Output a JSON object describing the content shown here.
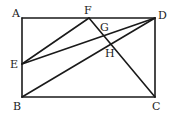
{
  "diagram": {
    "type": "geometry",
    "shape": "rectangle ABCD with segments",
    "points": {
      "A": {
        "label": "A",
        "x": 22,
        "y": 18,
        "lx": 12,
        "ly": 17
      },
      "B": {
        "label": "B",
        "x": 22,
        "y": 97,
        "lx": 13,
        "ly": 110
      },
      "C": {
        "label": "C",
        "x": 155,
        "y": 97,
        "lx": 153,
        "ly": 110
      },
      "D": {
        "label": "D",
        "x": 155,
        "y": 18,
        "lx": 158,
        "ly": 18
      },
      "E": {
        "label": "E",
        "x": 22,
        "y": 64,
        "lx": 10,
        "ly": 67
      },
      "F": {
        "label": "F",
        "x": 89,
        "y": 18,
        "lx": 84,
        "ly": 14
      },
      "G": {
        "label": "G",
        "x": 99,
        "y": 31,
        "lx": 100,
        "ly": 30
      },
      "H": {
        "label": "H",
        "x": 107,
        "y": 45,
        "lx": 106,
        "ly": 57
      }
    },
    "segments": [
      [
        "A",
        "D"
      ],
      [
        "D",
        "C"
      ],
      [
        "C",
        "B"
      ],
      [
        "B",
        "A"
      ],
      [
        "E",
        "F"
      ],
      [
        "E",
        "D"
      ],
      [
        "B",
        "D"
      ],
      [
        "F",
        "C"
      ]
    ],
    "stroke_color": "#1a1a1a",
    "background": "#ffffff"
  }
}
